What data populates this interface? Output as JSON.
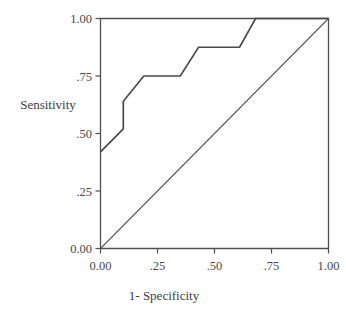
{
  "chart_data": {
    "type": "line",
    "title": "",
    "xlabel": "1- Specificity",
    "ylabel": "Sensitivity",
    "xlim": [
      0.0,
      1.0
    ],
    "ylim": [
      0.0,
      1.0
    ],
    "grid": false,
    "legend": "none",
    "x_tick_labels": [
      "0.00",
      ".25",
      ".50",
      ".75",
      "1.00"
    ],
    "x_tick_values": [
      0.0,
      0.25,
      0.5,
      0.75,
      1.0
    ],
    "y_tick_labels": [
      "0.00",
      ".25",
      ".50",
      ".75",
      "1.00"
    ],
    "y_tick_values": [
      0.0,
      0.25,
      0.5,
      0.75,
      1.0
    ],
    "series": [
      {
        "name": "ROC curve",
        "x": [
          0.0,
          0.1,
          0.1,
          0.19,
          0.35,
          0.43,
          0.61,
          0.68,
          1.0
        ],
        "y": [
          0.42,
          0.52,
          0.64,
          0.75,
          0.75,
          0.875,
          0.875,
          1.0,
          1.0
        ]
      },
      {
        "name": "Reference line",
        "x": [
          0.0,
          1.0
        ],
        "y": [
          0.0,
          1.0
        ]
      }
    ]
  },
  "colors": {
    "curve": "#4a4a4a",
    "reference": "#5a5a5a",
    "frame": "#4f4f4f",
    "text": "#3d3d3d",
    "background": "#ffffff"
  },
  "axis": {
    "x_title": "1- Specificity",
    "y_title": "Sensitivity"
  },
  "ticks": {
    "y": {
      "t0": "1.00",
      "t1": ".75",
      "t2": ".50",
      "t3": ".25",
      "t4": "0.00"
    },
    "x": {
      "t0": "0.00",
      "t1": ".25",
      "t2": ".50",
      "t3": ".75",
      "t4": "1.00"
    }
  }
}
